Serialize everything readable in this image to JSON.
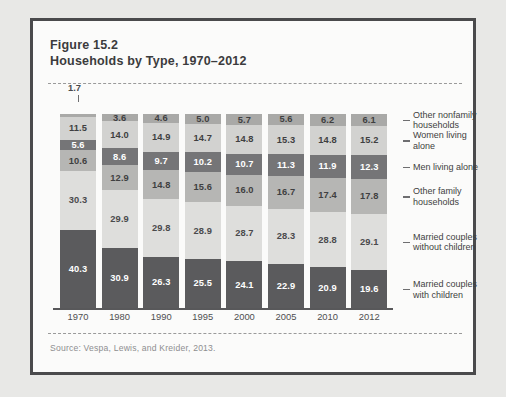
{
  "figure": {
    "number_line": "Figure 15.2",
    "title_line": "Households by Type, 1970–2012",
    "source": "Source: Vespa, Lewis, and Kreider, 2013."
  },
  "chart_data": {
    "type": "bar",
    "stacked": true,
    "title": "Households by Type, 1970–2012",
    "xlabel": "",
    "ylabel": "",
    "ylim": [
      0,
      100
    ],
    "grid": false,
    "legend_position": "right",
    "categories": [
      "1970",
      "1980",
      "1990",
      "1995",
      "2000",
      "2005",
      "2010",
      "2012"
    ],
    "series": [
      {
        "name": "Married couples with children",
        "color": "#5b5b5d",
        "text_color": "#ffffff",
        "values": [
          40.3,
          30.9,
          26.3,
          25.5,
          24.1,
          22.9,
          20.9,
          19.6
        ]
      },
      {
        "name": "Married couples without children",
        "color": "#dededc",
        "text_color": "#4a4a4c",
        "values": [
          30.3,
          29.9,
          29.8,
          28.9,
          28.7,
          28.3,
          28.8,
          29.1
        ]
      },
      {
        "name": "Other family households",
        "color": "#b6b6b4",
        "text_color": "#3f3f41",
        "values": [
          10.6,
          12.9,
          14.8,
          15.6,
          16.0,
          16.7,
          17.4,
          17.8
        ]
      },
      {
        "name": "Men living alone",
        "color": "#757577",
        "text_color": "#ffffff",
        "values": [
          5.6,
          8.6,
          9.7,
          10.2,
          10.7,
          11.3,
          11.9,
          12.3
        ]
      },
      {
        "name": "Women living alone",
        "color": "#d2d2d0",
        "text_color": "#3f3f41",
        "values": [
          11.5,
          14.0,
          14.9,
          14.7,
          14.8,
          15.3,
          14.8,
          15.2
        ]
      },
      {
        "name": "Other nonfamily households",
        "color": "#a9a9a7",
        "text_color": "#3f3f41",
        "values": [
          1.7,
          3.6,
          4.6,
          5.0,
          5.7,
          5.6,
          6.2,
          6.1
        ]
      }
    ],
    "annotations": [
      {
        "label": "1.7",
        "note": "callout above 1970 bar top segment"
      }
    ],
    "legend_labels": [
      "Other nonfamily households",
      "Women living alone",
      "Men living alone",
      "Other family households",
      "Married couples without children",
      "Married couples with children"
    ]
  }
}
